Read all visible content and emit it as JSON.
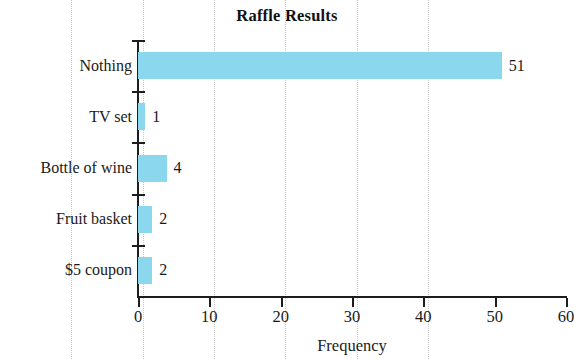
{
  "chart_data": {
    "type": "bar",
    "orientation": "horizontal",
    "title": "Raffle Results",
    "xlabel": "Frequency",
    "ylabel": "",
    "categories": [
      "Nothing",
      "TV set",
      "Bottle of wine",
      "Fruit basket",
      "$5 coupon"
    ],
    "values": [
      51,
      1,
      4,
      2,
      2
    ],
    "value_labels": [
      "51",
      "1",
      "4",
      "2",
      "2"
    ],
    "xlim": [
      0,
      60
    ],
    "xticks": [
      0,
      10,
      20,
      30,
      40,
      50,
      60
    ],
    "xtick_labels": [
      "0",
      "10",
      "20",
      "30",
      "40",
      "50",
      "60"
    ],
    "grid": "vertical-dotted",
    "legend": "none",
    "bar_color": "#8bd8ee",
    "axis_color": "#1d1d1d",
    "grid_color": "#c9c9c9",
    "text_color": "#1a1a1a"
  }
}
